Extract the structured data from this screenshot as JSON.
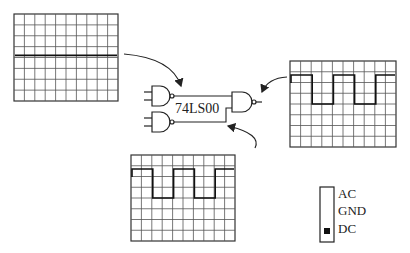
{
  "diagram": {
    "chip_label": "74LS00",
    "colors": {
      "ink": "#222222",
      "grid": "#555555",
      "background": "#ffffff"
    },
    "scopes": [
      {
        "id": "input-a-scope",
        "x": 14,
        "y": 14,
        "w": 104,
        "h": 87,
        "cols": 10,
        "rows": 8,
        "trace": "flat"
      },
      {
        "id": "output-scope",
        "x": 290,
        "y": 61,
        "w": 106,
        "h": 86,
        "cols": 10,
        "rows": 8,
        "trace": "square"
      },
      {
        "id": "input-b-scope",
        "x": 131,
        "y": 155,
        "w": 104,
        "h": 86,
        "cols": 10,
        "rows": 8,
        "trace": "square"
      }
    ],
    "coupling_switch": {
      "options": [
        "AC",
        "GND",
        "DC"
      ],
      "selected": "DC"
    }
  }
}
